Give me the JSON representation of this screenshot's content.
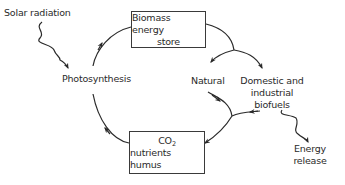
{
  "diagram": {
    "type": "cycle",
    "nodes": {
      "solar_radiation": "Solar radiation",
      "photosynthesis": "Photosynthesis",
      "biomass_store": {
        "line1": "Biomass energy",
        "line2": "store"
      },
      "natural": "Natural",
      "domestic": {
        "line1": "Domestic and",
        "line2": "industrial",
        "line3": "biofuels"
      },
      "co2_box": {
        "co": "CO",
        "sub": "2",
        "line2": "nutrients humus"
      },
      "energy_release": {
        "line1": "Energy",
        "line2": "release"
      }
    },
    "edges": [
      {
        "from": "Solar radiation",
        "to": "Photosynthesis",
        "style": "wavy"
      },
      {
        "from": "Photosynthesis",
        "to": "Biomass energy store",
        "style": "curved"
      },
      {
        "from": "Biomass energy store",
        "to": "Natural",
        "style": "curved"
      },
      {
        "from": "Biomass energy store",
        "to": "Domestic and industrial biofuels",
        "style": "curved"
      },
      {
        "from": "Natural",
        "to": "CO2 nutrients humus",
        "style": "curved"
      },
      {
        "from": "Domestic and industrial biofuels",
        "to": "CO2 nutrients humus",
        "style": "curved"
      },
      {
        "from": "Domestic and industrial biofuels",
        "to": "Energy release",
        "style": "wavy"
      },
      {
        "from": "CO2 nutrients humus",
        "to": "Photosynthesis",
        "style": "curved"
      }
    ],
    "line_color": "#2a2a2a"
  }
}
